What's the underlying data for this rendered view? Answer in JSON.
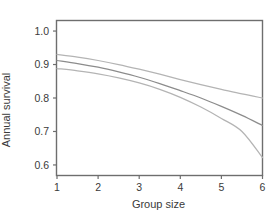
{
  "chart_data": {
    "type": "line",
    "title": "",
    "xlabel": "Group size",
    "ylabel": "Annual survival",
    "xlim": [
      1,
      6
    ],
    "ylim": [
      0.57,
      1.03
    ],
    "grid": false,
    "legend": null,
    "xticks": [
      "1",
      "2",
      "3",
      "4",
      "5",
      "6"
    ],
    "xtick_values": [
      1,
      2,
      3,
      4,
      5,
      6
    ],
    "yticks": [
      "0.6",
      "0.7",
      "0.8",
      "0.9",
      "1.0"
    ],
    "ytick_values": [
      0.6,
      0.7,
      0.8,
      0.9,
      1.0
    ],
    "x": [
      1,
      1.5,
      2,
      2.5,
      3,
      3.5,
      4,
      4.5,
      5,
      5.5,
      6
    ],
    "series": [
      {
        "name": "Upper confidence limit",
        "color": "#b4b4b4",
        "values": [
          0.93,
          0.922,
          0.912,
          0.9,
          0.886,
          0.871,
          0.855,
          0.84,
          0.826,
          0.812,
          0.8
        ]
      },
      {
        "name": "Predicted annual survival",
        "color": "#8c8c8c",
        "values": [
          0.912,
          0.903,
          0.892,
          0.878,
          0.862,
          0.843,
          0.822,
          0.8,
          0.775,
          0.748,
          0.718
        ]
      },
      {
        "name": "Lower confidence limit",
        "color": "#b4b4b4",
        "values": [
          0.888,
          0.881,
          0.872,
          0.86,
          0.845,
          0.826,
          0.802,
          0.773,
          0.739,
          0.7,
          0.622
        ]
      }
    ]
  },
  "axes": {
    "y_title": "Annual survival",
    "x_title": "Group size",
    "ytick_labels": [
      "1.0",
      "0.9",
      "0.8",
      "0.7",
      "0.6"
    ],
    "xtick_labels": [
      "1",
      "2",
      "3",
      "4",
      "5",
      "6"
    ]
  },
  "style": {
    "frame_color": "#6e6e6e",
    "text_color": "#3a3a3a",
    "background": "#ffffff"
  }
}
